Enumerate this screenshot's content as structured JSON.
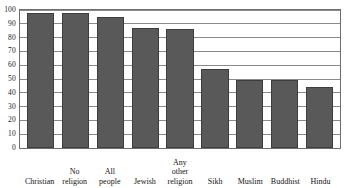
{
  "chart_data": {
    "type": "bar",
    "title": "",
    "subtitle": "",
    "xlabel": "",
    "ylabel": "",
    "categories": [
      "Christian",
      "No religion",
      "All people",
      "Jewish",
      "Any other religion",
      "Sikh",
      "Muslim",
      "Buddhist",
      "Hindu"
    ],
    "category_lines": [
      [
        "Christian"
      ],
      [
        "No",
        "religion"
      ],
      [
        "All",
        "people"
      ],
      [
        "Jewish"
      ],
      [
        "Any",
        "other",
        "religion"
      ],
      [
        "Sikh"
      ],
      [
        "Muslim"
      ],
      [
        "Buddhist"
      ],
      [
        "Hindu"
      ]
    ],
    "values": [
      98,
      98,
      95,
      87,
      86,
      57,
      49,
      49,
      44
    ],
    "ylim": [
      0,
      100
    ],
    "ytick_labels": [
      "0",
      "10",
      "20",
      "30",
      "40",
      "50",
      "60",
      "70",
      "80",
      "90",
      "100"
    ],
    "ytick_values": [
      0,
      10,
      20,
      30,
      40,
      50,
      60,
      70,
      80,
      90,
      100
    ],
    "grid": true,
    "grid_axis": "y",
    "legend": false,
    "legend_position": "none",
    "bar_color": "#595959",
    "bar_edge_color": "#3d3d3d",
    "grid_color": "#8a8a8a",
    "frame_color": "#6f6f6f",
    "background_color": "#ffffff"
  }
}
